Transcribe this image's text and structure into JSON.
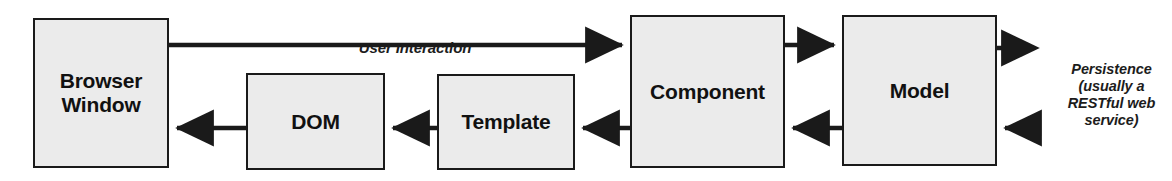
{
  "diagram": {
    "type": "flow-diagram",
    "canvas": {
      "width": 1172,
      "height": 181
    },
    "style": {
      "box_fill": "#ebebeb",
      "box_stroke": "#1a1a1a",
      "arrow_color": "#1a1a1a",
      "text_color": "#111111",
      "background": "#ffffff"
    },
    "nodes": [
      {
        "id": "browser-window",
        "label": "Browser\nWindow",
        "x": 33,
        "y": 18,
        "w": 136,
        "h": 150,
        "font_size": 21
      },
      {
        "id": "dom",
        "label": "DOM",
        "x": 246,
        "y": 73,
        "w": 139,
        "h": 97,
        "font_size": 21
      },
      {
        "id": "template",
        "label": "Template",
        "x": 437,
        "y": 74,
        "w": 138,
        "h": 96,
        "font_size": 21
      },
      {
        "id": "component",
        "label": "Component",
        "x": 630,
        "y": 15,
        "w": 155,
        "h": 153,
        "font_size": 21
      },
      {
        "id": "model",
        "label": "Model",
        "x": 842,
        "y": 15,
        "w": 155,
        "h": 151,
        "font_size": 21
      }
    ],
    "edges": [
      {
        "id": "browser-to-component",
        "from": "browser-window",
        "to": "component",
        "style": "solid",
        "direction": "right",
        "label": "User Interaction"
      },
      {
        "id": "component-to-model",
        "from": "component",
        "to": "model",
        "style": "solid",
        "direction": "right",
        "label": ""
      },
      {
        "id": "model-to-persistence",
        "from": "model",
        "to": "persistence",
        "style": "dashed",
        "direction": "right",
        "label": ""
      },
      {
        "id": "persistence-to-model",
        "from": "persistence",
        "to": "model",
        "style": "dashed",
        "direction": "left",
        "label": ""
      },
      {
        "id": "model-to-component",
        "from": "model",
        "to": "component",
        "style": "solid",
        "direction": "left",
        "label": ""
      },
      {
        "id": "component-to-template",
        "from": "component",
        "to": "template",
        "style": "solid",
        "direction": "left",
        "label": ""
      },
      {
        "id": "template-to-dom",
        "from": "template",
        "to": "dom",
        "style": "solid",
        "direction": "left",
        "label": ""
      },
      {
        "id": "dom-to-browser",
        "from": "dom",
        "to": "browser-window",
        "style": "solid",
        "direction": "left",
        "label": ""
      }
    ],
    "labels": {
      "user_interaction": "User Interaction",
      "persistence": "Persistence\n(usually a\nRESTful web\nservice)"
    }
  }
}
